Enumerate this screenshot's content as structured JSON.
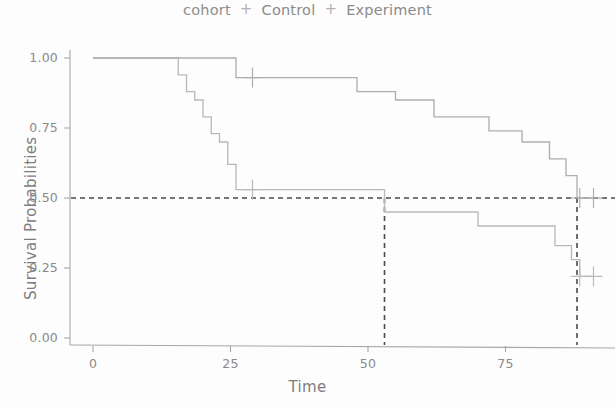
{
  "legend": {
    "title": "cohort",
    "key_glyph": "+",
    "items": [
      {
        "label": "Control",
        "color": "#b9b9b9"
      },
      {
        "label": "Experiment",
        "color": "#aeaeae"
      }
    ]
  },
  "axes": {
    "x": {
      "label": "Time",
      "ticks": [
        "0",
        "25",
        "50",
        "75"
      ],
      "tick_values": [
        0,
        25,
        50,
        75
      ],
      "range": [
        0,
        92
      ]
    },
    "y": {
      "label": "Survival Probabilities",
      "ticks": [
        "0.00",
        "0.25",
        "0.50",
        "0.75",
        "1.00"
      ],
      "tick_values": [
        0.0,
        0.25,
        0.5,
        0.75,
        1.0
      ],
      "range": [
        0,
        1
      ]
    }
  },
  "style": {
    "line_color": "#b4b4b4",
    "median_line_color": "#4a4a4a",
    "axis_color": "#a8a8a8",
    "text_color": "#8a8a8a",
    "background": "#fdfdfd"
  },
  "chart_data": {
    "type": "line",
    "title": "",
    "subtitle": "",
    "xlabel": "Time",
    "ylabel": "Survival Probabilities",
    "xlim": [
      0,
      92
    ],
    "ylim": [
      0,
      1
    ],
    "grid": false,
    "legend_position": "top",
    "legend_title": "cohort",
    "plot_kind": "kaplan-meier-step",
    "series": [
      {
        "name": "Control",
        "color": "#b9b9b9",
        "step": "post",
        "x": [
          0,
          15,
          15.5,
          17,
          18.5,
          20,
          21.5,
          23,
          24.5,
          26,
          53,
          70,
          84,
          87,
          88.5,
          91
        ],
        "y": [
          1.0,
          1.0,
          0.94,
          0.88,
          0.85,
          0.79,
          0.73,
          0.7,
          0.62,
          0.53,
          0.45,
          0.4,
          0.33,
          0.28,
          0.22,
          0.22
        ],
        "censored_points": [
          {
            "x": 29,
            "y": 0.53
          },
          {
            "x": 88.5,
            "y": 0.22
          },
          {
            "x": 91,
            "y": 0.22
          }
        ]
      },
      {
        "name": "Experiment",
        "color": "#aeaeae",
        "step": "post",
        "x": [
          0,
          16,
          25.5,
          26,
          40,
          48,
          55,
          62,
          72,
          78,
          83,
          86,
          88,
          91
        ],
        "y": [
          1.0,
          1.0,
          1.0,
          0.93,
          0.93,
          0.88,
          0.85,
          0.79,
          0.74,
          0.7,
          0.64,
          0.58,
          0.5,
          0.5
        ],
        "censored_points": [
          {
            "x": 29,
            "y": 0.93
          },
          {
            "x": 88.5,
            "y": 0.5
          },
          {
            "x": 91,
            "y": 0.5
          }
        ]
      }
    ],
    "reference_lines": [
      {
        "orientation": "horizontal",
        "value": 0.5,
        "style": "dashed",
        "color": "#4a4a4a"
      },
      {
        "orientation": "vertical",
        "value": 53,
        "style": "dashed",
        "color": "#4a4a4a",
        "note": "median survival Control"
      },
      {
        "orientation": "vertical",
        "value": 88,
        "style": "dashed",
        "color": "#4a4a4a",
        "note": "median survival Experiment"
      }
    ]
  }
}
